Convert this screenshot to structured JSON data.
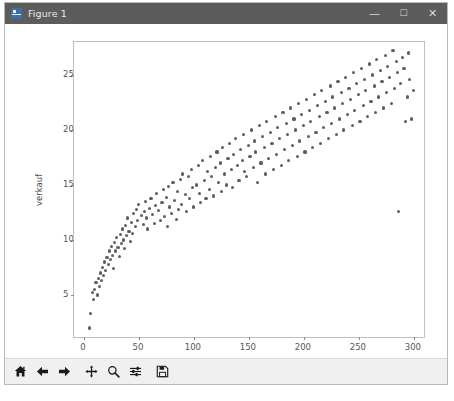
{
  "window": {
    "title": "Figure 1",
    "icon": "matplotlib-figure-icon",
    "controls": {
      "minimize": "—",
      "maximize": "☐",
      "close": "✕"
    }
  },
  "toolbar": {
    "buttons": [
      {
        "name": "home-icon",
        "tooltip": "Reset original view"
      },
      {
        "name": "back-arrow-icon",
        "tooltip": "Back to previous view"
      },
      {
        "name": "forward-arrow-icon",
        "tooltip": "Forward to next view"
      },
      {
        "name": "pan-move-icon",
        "tooltip": "Pan axes with left mouse, zoom with right"
      },
      {
        "name": "zoom-magnifier-icon",
        "tooltip": "Zoom to rectangle"
      },
      {
        "name": "configure-subplots-icon",
        "tooltip": "Configure subplots"
      },
      {
        "name": "save-floppy-icon",
        "tooltip": "Save the figure"
      }
    ]
  },
  "chart_data": {
    "type": "scatter",
    "title": "",
    "xlabel": "anzeigen",
    "ylabel": "verkauf",
    "xlim": [
      -9,
      311
    ],
    "ylim": [
      1.0,
      28.0
    ],
    "xticks": [
      0,
      50,
      100,
      150,
      200,
      250,
      300
    ],
    "yticks": [
      5,
      10,
      15,
      20,
      25
    ],
    "grid": false,
    "legend": null,
    "marker": {
      "color": "#5e5e63",
      "size": 3.2,
      "shape": "circle"
    },
    "n_points": 200,
    "points": [
      [
        5,
        2.0
      ],
      [
        6,
        3.3
      ],
      [
        8,
        5.2
      ],
      [
        9,
        4.6
      ],
      [
        10,
        5.5
      ],
      [
        11,
        6.1
      ],
      [
        12,
        5.0
      ],
      [
        13,
        6.5
      ],
      [
        14,
        5.8
      ],
      [
        15,
        7.0
      ],
      [
        16,
        6.3
      ],
      [
        17,
        7.5
      ],
      [
        18,
        6.8
      ],
      [
        19,
        8.0
      ],
      [
        20,
        7.2
      ],
      [
        21,
        8.4
      ],
      [
        22,
        7.8
      ],
      [
        23,
        9.0
      ],
      [
        24,
        8.2
      ],
      [
        25,
        9.4
      ],
      [
        26,
        8.6
      ],
      [
        27,
        7.4
      ],
      [
        28,
        9.8
      ],
      [
        29,
        9.0
      ],
      [
        30,
        10.2
      ],
      [
        31,
        9.3
      ],
      [
        32,
        8.5
      ],
      [
        33,
        10.5
      ],
      [
        34,
        9.7
      ],
      [
        35,
        11.0
      ],
      [
        36,
        10.0
      ],
      [
        37,
        9.2
      ],
      [
        38,
        11.3
      ],
      [
        39,
        10.4
      ],
      [
        40,
        12.0
      ],
      [
        41,
        10.8
      ],
      [
        42,
        9.9
      ],
      [
        43,
        11.6
      ],
      [
        44,
        10.6
      ],
      [
        45,
        12.4
      ],
      [
        47,
        11.2
      ],
      [
        48,
        12.8
      ],
      [
        49,
        11.8
      ],
      [
        50,
        13.2
      ],
      [
        52,
        12.2
      ],
      [
        54,
        11.4
      ],
      [
        55,
        12.6
      ],
      [
        56,
        13.5
      ],
      [
        57,
        12.0
      ],
      [
        58,
        11.0
      ],
      [
        60,
        12.9
      ],
      [
        61,
        13.8
      ],
      [
        62,
        12.3
      ],
      [
        64,
        11.5
      ],
      [
        65,
        13.1
      ],
      [
        66,
        14.2
      ],
      [
        68,
        12.7
      ],
      [
        70,
        11.8
      ],
      [
        71,
        13.4
      ],
      [
        72,
        14.6
      ],
      [
        73,
        12.1
      ],
      [
        75,
        13.9
      ],
      [
        76,
        11.2
      ],
      [
        77,
        14.9
      ],
      [
        78,
        13.0
      ],
      [
        80,
        12.4
      ],
      [
        81,
        15.2
      ],
      [
        82,
        13.6
      ],
      [
        84,
        11.9
      ],
      [
        85,
        14.4
      ],
      [
        86,
        12.8
      ],
      [
        88,
        15.5
      ],
      [
        89,
        13.2
      ],
      [
        90,
        16.0
      ],
      [
        92,
        14.1
      ],
      [
        93,
        12.6
      ],
      [
        95,
        15.8
      ],
      [
        96,
        13.8
      ],
      [
        98,
        16.4
      ],
      [
        99,
        14.8
      ],
      [
        100,
        13.0
      ],
      [
        102,
        15.0
      ],
      [
        104,
        16.8
      ],
      [
        105,
        14.2
      ],
      [
        106,
        13.4
      ],
      [
        108,
        17.2
      ],
      [
        110,
        15.4
      ],
      [
        111,
        13.8
      ],
      [
        112,
        16.2
      ],
      [
        114,
        14.6
      ],
      [
        115,
        17.6
      ],
      [
        116,
        15.8
      ],
      [
        118,
        14.0
      ],
      [
        120,
        16.6
      ],
      [
        121,
        18.0
      ],
      [
        122,
        15.2
      ],
      [
        124,
        17.0
      ],
      [
        125,
        14.4
      ],
      [
        126,
        18.4
      ],
      [
        128,
        16.0
      ],
      [
        130,
        15.0
      ],
      [
        131,
        17.4
      ],
      [
        132,
        18.8
      ],
      [
        134,
        16.4
      ],
      [
        135,
        14.8
      ],
      [
        136,
        17.8
      ],
      [
        138,
        19.2
      ],
      [
        140,
        16.8
      ],
      [
        141,
        15.4
      ],
      [
        142,
        18.2
      ],
      [
        144,
        17.2
      ],
      [
        145,
        19.6
      ],
      [
        146,
        16.2
      ],
      [
        148,
        15.8
      ],
      [
        150,
        18.6
      ],
      [
        151,
        17.6
      ],
      [
        152,
        20.0
      ],
      [
        154,
        16.6
      ],
      [
        155,
        19.0
      ],
      [
        156,
        18.0
      ],
      [
        158,
        15.2
      ],
      [
        160,
        20.4
      ],
      [
        161,
        17.0
      ],
      [
        162,
        19.4
      ],
      [
        164,
        18.4
      ],
      [
        165,
        16.0
      ],
      [
        166,
        20.8
      ],
      [
        168,
        17.4
      ],
      [
        170,
        19.8
      ],
      [
        171,
        18.8
      ],
      [
        172,
        16.4
      ],
      [
        174,
        21.2
      ],
      [
        175,
        17.8
      ],
      [
        176,
        20.2
      ],
      [
        178,
        19.2
      ],
      [
        180,
        16.8
      ],
      [
        181,
        21.6
      ],
      [
        182,
        18.2
      ],
      [
        184,
        20.6
      ],
      [
        185,
        19.6
      ],
      [
        186,
        17.2
      ],
      [
        188,
        22.0
      ],
      [
        190,
        18.6
      ],
      [
        191,
        21.0
      ],
      [
        192,
        20.0
      ],
      [
        194,
        17.6
      ],
      [
        195,
        22.4
      ],
      [
        196,
        19.0
      ],
      [
        198,
        21.4
      ],
      [
        200,
        20.4
      ],
      [
        201,
        18.0
      ],
      [
        202,
        22.8
      ],
      [
        204,
        19.4
      ],
      [
        205,
        21.8
      ],
      [
        206,
        20.8
      ],
      [
        208,
        18.4
      ],
      [
        210,
        23.2
      ],
      [
        211,
        19.8
      ],
      [
        212,
        22.2
      ],
      [
        214,
        21.2
      ],
      [
        215,
        18.8
      ],
      [
        216,
        23.6
      ],
      [
        218,
        20.2
      ],
      [
        220,
        22.6
      ],
      [
        221,
        21.6
      ],
      [
        222,
        19.2
      ],
      [
        224,
        24.0
      ],
      [
        225,
        20.6
      ],
      [
        226,
        23.0
      ],
      [
        228,
        22.0
      ],
      [
        230,
        19.6
      ],
      [
        231,
        24.4
      ],
      [
        232,
        21.0
      ],
      [
        234,
        23.4
      ],
      [
        235,
        22.4
      ],
      [
        236,
        20.0
      ],
      [
        238,
        24.8
      ],
      [
        240,
        21.4
      ],
      [
        241,
        23.8
      ],
      [
        242,
        22.8
      ],
      [
        244,
        20.4
      ],
      [
        245,
        25.2
      ],
      [
        246,
        21.8
      ],
      [
        248,
        24.2
      ],
      [
        250,
        23.2
      ],
      [
        251,
        20.8
      ],
      [
        252,
        25.6
      ],
      [
        254,
        22.2
      ],
      [
        255,
        24.6
      ],
      [
        256,
        23.6
      ],
      [
        258,
        21.2
      ],
      [
        260,
        26.0
      ],
      [
        261,
        22.6
      ],
      [
        262,
        25.0
      ],
      [
        264,
        24.0
      ],
      [
        265,
        21.6
      ],
      [
        266,
        26.4
      ],
      [
        268,
        23.0
      ],
      [
        270,
        25.4
      ],
      [
        271,
        24.4
      ],
      [
        272,
        22.0
      ],
      [
        274,
        26.8
      ],
      [
        275,
        23.4
      ],
      [
        276,
        25.8
      ],
      [
        278,
        24.8
      ],
      [
        280,
        22.4
      ],
      [
        281,
        27.2
      ],
      [
        282,
        23.8
      ],
      [
        284,
        26.2
      ],
      [
        285,
        25.2
      ],
      [
        286,
        12.6
      ],
      [
        288,
        24.2
      ],
      [
        290,
        26.6
      ],
      [
        291,
        25.6
      ],
      [
        292,
        20.8
      ],
      [
        294,
        23.0
      ],
      [
        295,
        27.0
      ],
      [
        296,
        24.6
      ],
      [
        298,
        21.0
      ],
      [
        300,
        23.6
      ]
    ]
  }
}
